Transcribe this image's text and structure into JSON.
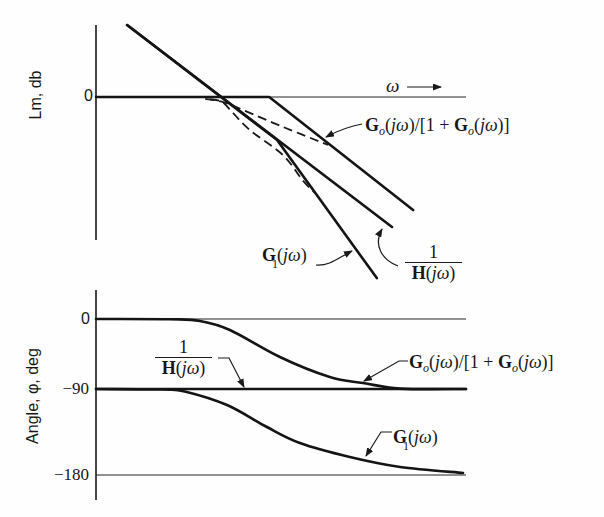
{
  "chart_data": [
    {
      "id": "magnitude",
      "type": "line",
      "title": "",
      "xlabel": "ω",
      "xlabel_arrow": "→",
      "ylabel": "Lm, db",
      "xlim": [
        0,
        100
      ],
      "ylim": [
        -40,
        20
      ],
      "yticks": [
        0
      ],
      "yticklabels": [
        "0"
      ],
      "grid": false,
      "legend": "none (curves labeled directly)",
      "series": [
        {
          "id": "zero-db-reference-line",
          "name": "0 dB reference",
          "style": "thin",
          "points": [
            [
              0,
              0
            ],
            [
              100,
              0
            ]
          ]
        },
        {
          "id": "closed-loop-asymptote",
          "name": "Go(jω)/[1+Go(jω)]",
          "style": "thick",
          "points": [
            [
              0,
              0
            ],
            [
              46.8,
              0
            ],
            [
              85.7,
              -31.4
            ]
          ]
        },
        {
          "id": "g1-asymptote",
          "name": "G1(jω)",
          "style": "thick",
          "points": [
            [
              8.4,
              20
            ],
            [
              48.9,
              -11.9
            ],
            [
              75.9,
              -50.3
            ]
          ]
        },
        {
          "id": "inverse-h-asymptote",
          "name": "1/H(jω)",
          "style": "thick",
          "points": [
            [
              8.4,
              20
            ],
            [
              80.0,
              -36.1
            ]
          ]
        },
        {
          "id": "dashed-curve-upper",
          "name": "dashed curve (upper)",
          "style": "dashed",
          "smooth": true,
          "points": [
            [
              29.5,
              -0.5
            ],
            [
              34.6,
              -1.5
            ],
            [
              39.7,
              -3.6
            ],
            [
              50.5,
              -8.3
            ],
            [
              62.7,
              -13.3
            ]
          ]
        },
        {
          "id": "dashed-curve-lower",
          "name": "dashed curve (lower)",
          "style": "dashed",
          "smooth": true,
          "points": [
            [
              30.8,
              -0.6
            ],
            [
              34.1,
              -1.4
            ],
            [
              36.8,
              -4.2
            ],
            [
              41.6,
              -9.2
            ],
            [
              50.5,
              -16.1
            ],
            [
              55.9,
              -23.2
            ],
            [
              59.5,
              -27.0
            ]
          ]
        }
      ],
      "annotations": [
        {
          "id": "closed-loop-label",
          "text": "Go(jω)/[1+Go(jω)]",
          "parts": {
            "g": "G",
            "sub": "o",
            "a1": "(",
            "j": "jω",
            "a2": ")/[1 + ",
            "g2": "G",
            "sub2": "o",
            "a3": "(",
            "j2": "jω",
            "a4": ")]"
          }
        },
        {
          "id": "g1-label",
          "text": "G1(jω)",
          "parts": {
            "g": "G",
            "sub": "1",
            "a1": "(",
            "j": "jω",
            "a2": ")"
          }
        },
        {
          "id": "inverse-h-label",
          "text": "1/H(jω)",
          "parts": {
            "num": "1",
            "h": "H",
            "a1": "(",
            "j": "jω",
            "a2": ")"
          }
        }
      ]
    },
    {
      "id": "phase",
      "type": "line",
      "title": "",
      "xlabel": "",
      "ylabel": "Angle, φ, deg",
      "xlim": [
        0,
        100
      ],
      "ylim": [
        -200,
        10
      ],
      "yticks": [
        0,
        -90,
        -180
      ],
      "yticklabels": [
        "0",
        "−90",
        "−180"
      ],
      "grid": false,
      "legend": "none (curves labeled directly)",
      "series": [
        {
          "id": "zero-deg-reference-line",
          "name": "0° reference",
          "style": "thin",
          "points": [
            [
              0,
              0
            ],
            [
              100,
              0
            ]
          ]
        },
        {
          "id": "minus-180-reference-line",
          "name": "−180° reference",
          "style": "thin",
          "points": [
            [
              0,
              -180
            ],
            [
              100,
              -180
            ]
          ]
        },
        {
          "id": "inverse-h-phase",
          "name": "1/H(jω)",
          "style": "thick",
          "points": [
            [
              0,
              -90
            ],
            [
              100,
              -90
            ]
          ]
        },
        {
          "id": "closed-loop-phase",
          "name": "Go(jω)/[1+Go(jω)]",
          "style": "thick",
          "smooth": true,
          "points": [
            [
              0,
              0
            ],
            [
              20,
              -0.3
            ],
            [
              28.1,
              -2.6
            ],
            [
              36.2,
              -14.1
            ],
            [
              49.7,
              -48.9
            ],
            [
              63.2,
              -74.6
            ],
            [
              72.2,
              -82.3
            ],
            [
              82.2,
              -89.5
            ],
            [
              100,
              -90
            ]
          ]
        },
        {
          "id": "g1-phase",
          "name": "G1(jω)",
          "style": "thick",
          "smooth": true,
          "points": [
            [
              0,
              -90
            ],
            [
              18,
              -90.5
            ],
            [
              24,
              -92.5
            ],
            [
              35.4,
              -106.7
            ],
            [
              46.2,
              -129.8
            ],
            [
              55.1,
              -146.5
            ],
            [
              68.6,
              -161.2
            ],
            [
              82.2,
              -171.6
            ],
            [
              99.2,
              -177.9
            ]
          ]
        }
      ],
      "annotations": [
        {
          "id": "inverse-h-label",
          "text": "1/H(jω)",
          "parts": {
            "num": "1",
            "h": "H",
            "a1": "(",
            "j": "jω",
            "a2": ")"
          }
        },
        {
          "id": "closed-loop-label",
          "text": "Go(jω)/[1+Go(jω)]",
          "parts": {
            "g": "G",
            "sub": "o",
            "a1": "(",
            "j": "jω",
            "a2": ")/[1 + ",
            "g2": "G",
            "sub2": "o",
            "a3": "(",
            "j2": "jω",
            "a4": ")]"
          }
        },
        {
          "id": "g1-label",
          "text": "G1(jω)",
          "parts": {
            "g": "G",
            "sub": "1",
            "a1": "(",
            "j": "jω",
            "a2": ")"
          }
        }
      ]
    }
  ]
}
